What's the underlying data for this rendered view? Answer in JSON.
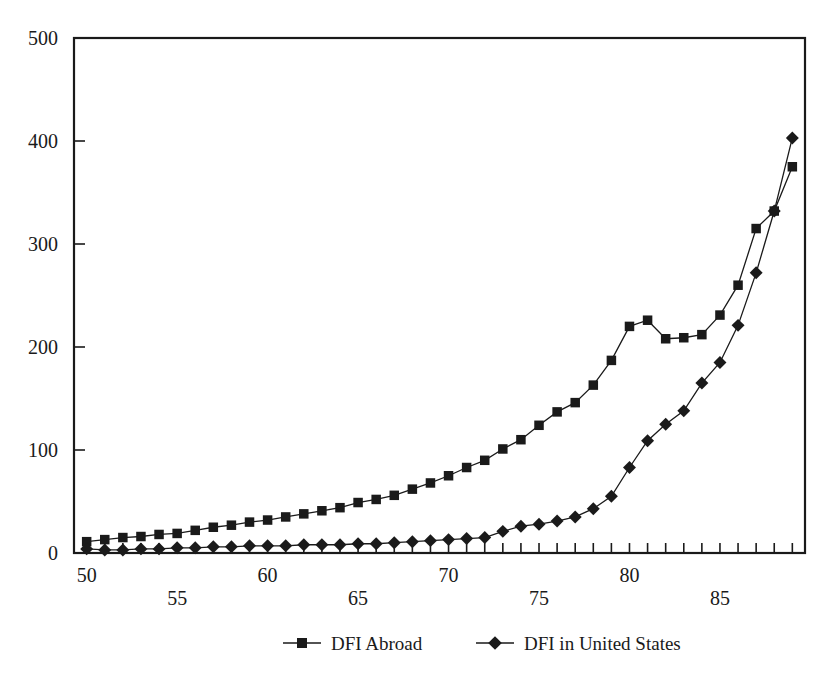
{
  "chart_data": {
    "type": "line",
    "title": "",
    "subtitle": "",
    "xlabel": "",
    "ylabel": "",
    "xlim": [
      49.3,
      89.7
    ],
    "ylim": [
      0,
      500
    ],
    "grid": false,
    "legend_position": "bottom-center",
    "y_ticks": [
      0,
      100,
      200,
      300,
      400,
      500
    ],
    "y_tick_labels": [
      "0",
      "100",
      "200",
      "300",
      "400",
      "500"
    ],
    "x_ticks": [
      50,
      51,
      52,
      53,
      54,
      55,
      56,
      57,
      58,
      59,
      60,
      61,
      62,
      63,
      64,
      65,
      66,
      67,
      68,
      69,
      70,
      71,
      72,
      73,
      74,
      75,
      76,
      77,
      78,
      79,
      80,
      81,
      82,
      83,
      84,
      85,
      86,
      87,
      88,
      89
    ],
    "x_tick_labels_upper": [
      "50",
      "60",
      "70",
      "80"
    ],
    "x_tick_labels_upper_values": [
      50,
      60,
      70,
      80
    ],
    "x_tick_labels_lower": [
      "55",
      "65",
      "75",
      "85"
    ],
    "x_tick_labels_lower_values": [
      55,
      65,
      75,
      85
    ],
    "x": [
      50,
      51,
      52,
      53,
      54,
      55,
      56,
      57,
      58,
      59,
      60,
      61,
      62,
      63,
      64,
      65,
      66,
      67,
      68,
      69,
      70,
      71,
      72,
      73,
      74,
      75,
      76,
      77,
      78,
      79,
      80,
      81,
      82,
      83,
      84,
      85,
      86,
      87,
      88,
      89
    ],
    "series": [
      {
        "name": "DFI Abroad",
        "marker": "square",
        "color": "#1a1a1a",
        "values": [
          11,
          13,
          15,
          16,
          18,
          19,
          22,
          25,
          27,
          30,
          32,
          35,
          38,
          41,
          44,
          49,
          52,
          56,
          62,
          68,
          75,
          83,
          90,
          101,
          110,
          124,
          137,
          146,
          163,
          187,
          220,
          226,
          208,
          209,
          212,
          231,
          260,
          315,
          332,
          375
        ]
      },
      {
        "name": "DFI in United States",
        "marker": "diamond",
        "color": "#1a1a1a",
        "values": [
          4,
          3,
          3,
          4,
          4,
          5,
          5,
          6,
          6,
          7,
          7,
          7,
          8,
          8,
          8,
          9,
          9,
          10,
          11,
          12,
          13,
          14,
          15,
          21,
          26,
          28,
          31,
          35,
          43,
          55,
          83,
          109,
          125,
          138,
          165,
          185,
          221,
          272,
          332,
          403
        ]
      }
    ]
  },
  "legend": {
    "items": [
      {
        "label": "DFI Abroad",
        "marker": "square"
      },
      {
        "label": "DFI in United States",
        "marker": "diamond"
      }
    ]
  }
}
